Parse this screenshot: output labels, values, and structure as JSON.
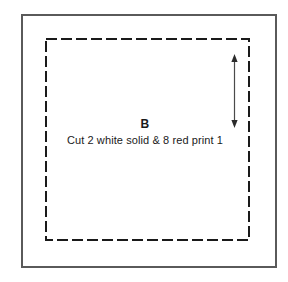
{
  "page": {
    "background_color": "#ffffff",
    "width": 288,
    "height": 282
  },
  "pattern": {
    "outer_block": {
      "name": "outer-cut-rectangle",
      "style": "solid",
      "stroke_color": "#5a5a5a",
      "stroke_width": 2
    },
    "inner_block": {
      "name": "inner-dashed-rectangle",
      "style": "dashed",
      "stroke_color": "#1a1a1a",
      "stroke_width": 2,
      "dash_length": 11,
      "dash_gap": 4
    },
    "measurement_arrow": {
      "name": "vertical-double-headed-arrow",
      "orientation": "vertical",
      "heads": "both",
      "stroke_color": "#3a3a3a",
      "label": ""
    },
    "piece_letter": "B",
    "cut_instructions": "Cut 2 white solid & 8 red print 1"
  }
}
